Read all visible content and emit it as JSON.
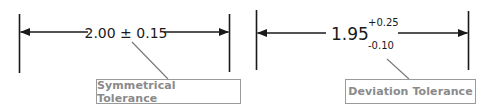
{
  "colors": {
    "line": "#1a1a1a",
    "leader": "#777777",
    "label_border": "#9a9a9a",
    "label_text": "#8a8a8a"
  },
  "diagrams": [
    {
      "id": "symmetrical",
      "dimension_text": "2.00 ± 0.15",
      "nominal": "2.00",
      "tolerance": "± 0.15",
      "label": "Symmetrical Tolerance"
    },
    {
      "id": "deviation",
      "nominal": "1.95",
      "upper_deviation": "+0.25",
      "lower_deviation": "-0.10",
      "label": "Deviation Tolerance"
    }
  ]
}
